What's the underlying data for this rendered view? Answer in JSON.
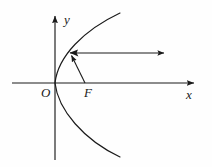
{
  "figure": {
    "name": "parabola-reflection-diagram",
    "background_color": "#fefefe",
    "stroke_color": "#1a1a1a"
  },
  "axes": {
    "x_label": "x",
    "y_label": "y",
    "origin_label": "O",
    "x_axis": {
      "x_start": 12,
      "x_end": 196,
      "y": 83
    },
    "y_axis": {
      "x": 55,
      "y_start": 14,
      "y_end": 160
    }
  },
  "points": {
    "origin": {
      "label": "O",
      "x": 55,
      "y": 83
    },
    "focus": {
      "label": "F",
      "x": 85,
      "y": 83
    },
    "incidence": {
      "x": 70,
      "y": 53
    }
  },
  "curve": {
    "type": "parabola",
    "opens": "right",
    "vertex": {
      "x": 55,
      "y": 83
    },
    "upper_end": {
      "x": 120,
      "y": 13
    },
    "lower_end": {
      "x": 120,
      "y": 157
    }
  },
  "rays": {
    "focal_ray": {
      "from": {
        "x": 85,
        "y": 83
      },
      "to": {
        "x": 70,
        "y": 53
      },
      "arrow": "at-curve"
    },
    "reflected_ray": {
      "from": {
        "x": 70,
        "y": 53
      },
      "to": {
        "x": 166,
        "y": 53
      },
      "arrow": "at-end"
    }
  }
}
